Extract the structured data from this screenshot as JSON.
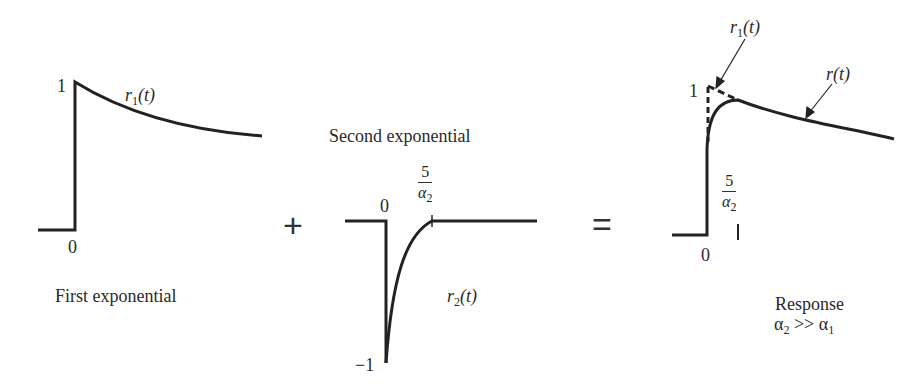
{
  "panels": {
    "first": {
      "caption": "First exponential",
      "curve_label": "r",
      "curve_sub": "1",
      "curve_arg": "(t)",
      "y_tick": "1",
      "x_tick": "0"
    },
    "operator_plus": "+",
    "second": {
      "caption": "Second exponential",
      "curve_label": "r",
      "curve_sub": "2",
      "curve_arg": "(t)",
      "y_tick": "−1",
      "x_tick": "0",
      "marker_num": "5",
      "marker_den": "α",
      "marker_den_sub": "2"
    },
    "operator_equals": "=",
    "response": {
      "caption_line1": "Response",
      "caption_line2_a": "α",
      "caption_line2_a_sub": "2",
      "caption_line2_op": " >> ",
      "caption_line2_b": "α",
      "caption_line2_b_sub": "1",
      "arrow1_label": "r",
      "arrow1_sub": "1",
      "arrow1_arg": "(t)",
      "arrow2_label": "r(t)",
      "y_tick": "1",
      "x_tick": "0",
      "marker_num": "5",
      "marker_den": "α",
      "marker_den_sub": "2",
      "marker_tick": "I"
    }
  }
}
